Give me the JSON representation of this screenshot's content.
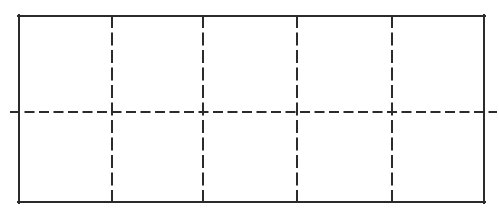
{
  "figure": {
    "type": "line-diagram",
    "canvas": {
      "width": 499,
      "height": 217,
      "background": "#ffffff"
    },
    "colors": {
      "line": "#2b2b2b",
      "fill": "#ffffff"
    }
  },
  "chart_data": {
    "type": "diagram",
    "xlabel": "",
    "ylabel": "",
    "grid": true,
    "legend": null,
    "shapes": [
      {
        "name": "outer-rectangle",
        "style": "solid",
        "stroke": "#2b2b2b",
        "stroke_width": 2,
        "x": 18,
        "y": 15,
        "width": 467,
        "height": 188
      }
    ],
    "gridlines": {
      "vertical": {
        "style": "dashed",
        "count": 4,
        "positions": [
          112,
          203,
          297,
          392
        ],
        "y_start": 15,
        "y_end": 203,
        "dash_on": 13,
        "dash_off": 4.5
      },
      "horizontal": {
        "style": "dashed",
        "count": 1,
        "positions": [
          112
        ],
        "x_start": 10,
        "x_end": 497,
        "dash_on": 10,
        "dash_off": 4.5
      }
    },
    "cells": {
      "columns": 5,
      "rows": 2,
      "total": 10
    },
    "annotations": []
  }
}
